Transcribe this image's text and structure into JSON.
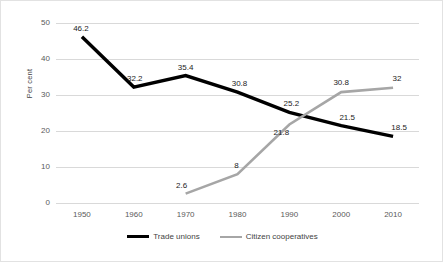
{
  "chart_data": {
    "type": "line",
    "title": "",
    "subtitle": "",
    "xlabel": "",
    "ylabel": "Per cent",
    "categories": [
      "1950",
      "1960",
      "1970",
      "1980",
      "1990",
      "2000",
      "2010"
    ],
    "ylim": [
      0,
      50
    ],
    "yticks": [
      "0",
      "10",
      "20",
      "30",
      "40",
      "50"
    ],
    "grid": "horizontal",
    "legend_position": "bottom-center",
    "series": [
      {
        "name": "Trade unions",
        "color": "#000000",
        "values": [
          46.2,
          32.2,
          35.4,
          30.8,
          25.2,
          21.5,
          18.5
        ],
        "labels": [
          "46.2",
          "32.2",
          "35.4",
          "30.8",
          "25.2",
          "21.5",
          "18.5"
        ]
      },
      {
        "name": "Citizen cooperatives",
        "color": "#a6a6a6",
        "values": [
          null,
          null,
          2.6,
          8,
          21.8,
          30.8,
          32
        ],
        "labels": [
          "",
          "",
          "2.6",
          "8",
          "21.8",
          "30.8",
          "32"
        ]
      }
    ]
  }
}
